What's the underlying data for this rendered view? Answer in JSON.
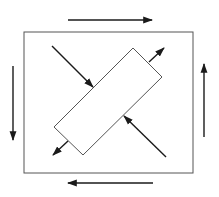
{
  "diagram": {
    "type": "pure-shear-stress-element",
    "colors": {
      "background": "#ffffff",
      "outline": "#555555",
      "arrow": "#1a1a1a"
    },
    "square": {
      "x": 24,
      "y": 32,
      "width": 169,
      "height": 141
    },
    "rotated_rect": {
      "points": [
        [
          133,
          48
        ],
        [
          162,
          77
        ],
        [
          83,
          155
        ],
        [
          54,
          127
        ]
      ]
    },
    "shear_arrows": [
      {
        "name": "top-shear-arrow-right",
        "x1": 68,
        "y1": 20,
        "x2": 152,
        "y2": 20
      },
      {
        "name": "bottom-shear-arrow-left",
        "x1": 153,
        "y1": 183,
        "x2": 68,
        "y2": 183
      },
      {
        "name": "left-shear-arrow-down",
        "x1": 13,
        "y1": 66,
        "x2": 13,
        "y2": 140
      },
      {
        "name": "right-shear-arrow-up",
        "x1": 204,
        "y1": 137,
        "x2": 204,
        "y2": 64
      }
    ],
    "normal_arrows": [
      {
        "name": "compression-arrow-top-left",
        "x1": 52,
        "y1": 46,
        "x2": 93,
        "y2": 87
      },
      {
        "name": "compression-arrow-bottom-right",
        "x1": 166,
        "y1": 157,
        "x2": 124,
        "y2": 116
      },
      {
        "name": "tension-arrow-top-right",
        "x1": 149,
        "y1": 62,
        "x2": 164,
        "y2": 48
      },
      {
        "name": "tension-arrow-bottom-left",
        "x1": 68,
        "y1": 141,
        "x2": 53,
        "y2": 155
      }
    ]
  }
}
